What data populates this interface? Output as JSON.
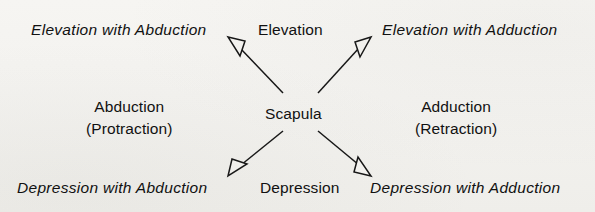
{
  "diagram": {
    "type": "radial-movement-diagram",
    "center": {
      "label": "Scapula"
    },
    "colors": {
      "ink": "#111111",
      "background": "#f4f3f0"
    },
    "labels": {
      "top_left": "Elevation with Abduction",
      "top_center": "Elevation",
      "top_right": "Elevation with Adduction",
      "middle_left_line1": "Abduction",
      "middle_left_line2": "(Protraction)",
      "middle_right_line1": "Adduction",
      "middle_right_line2": "(Retraction)",
      "bottom_left": "Depression with Abduction",
      "bottom_center": "Depression",
      "bottom_right": "Depression with Adduction"
    },
    "arrows": [
      {
        "name": "arrow-up-left",
        "direction": "up-left",
        "points_to": "Elevation with Abduction"
      },
      {
        "name": "arrow-up-right",
        "direction": "up-right",
        "points_to": "Elevation with Adduction"
      },
      {
        "name": "arrow-down-left",
        "direction": "down-left",
        "points_to": "Depression with Abduction"
      },
      {
        "name": "arrow-down-right",
        "direction": "down-right",
        "points_to": "Depression with Adduction"
      }
    ]
  }
}
